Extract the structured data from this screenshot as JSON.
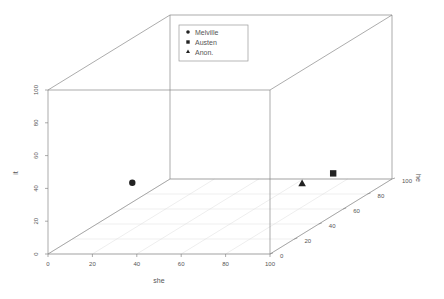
{
  "chart_data": {
    "type": "scatter",
    "subtype": "scatter3d",
    "title": "",
    "xlabel": "she",
    "ylabel": "he",
    "zlabel": "it",
    "xlim": [
      0,
      100
    ],
    "ylim": [
      0,
      100
    ],
    "zlim": [
      0,
      100
    ],
    "x_ticks": [
      0,
      20,
      40,
      60,
      80,
      100
    ],
    "y_ticks": [
      0,
      20,
      40,
      60,
      80,
      100
    ],
    "z_ticks": [
      0,
      20,
      40,
      60,
      80,
      100
    ],
    "grid": true,
    "legend_position": "top-center",
    "legend": [
      {
        "label": "Melville",
        "marker": "circle"
      },
      {
        "label": "Austen",
        "marker": "square"
      },
      {
        "label": "Anon.",
        "marker": "triangle"
      }
    ],
    "series": [
      {
        "name": "Melville",
        "marker": "circle",
        "points": [
          {
            "she": 5,
            "he": 60,
            "it": 16
          }
        ]
      },
      {
        "name": "Austen",
        "marker": "square",
        "points": [
          {
            "she": 79,
            "he": 90,
            "it": 8
          }
        ]
      },
      {
        "name": "Anon.",
        "marker": "triangle",
        "points": [
          {
            "she": 65,
            "he": 90,
            "it": 2
          }
        ]
      }
    ],
    "colors": {
      "axes": "#888888",
      "grid": "#dddddd",
      "markers": "#222222",
      "text": "#555555"
    }
  }
}
